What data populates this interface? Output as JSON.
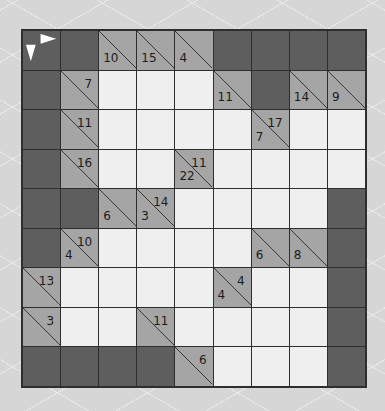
{
  "puzzle": {
    "type": "kakuro",
    "rows": 9,
    "cols": 9,
    "colors": {
      "block": "#5e5e5e",
      "clue": "#a5a5a5",
      "white": "#efefef",
      "grid_line": "#2e2e2e",
      "arrow": "#ffffff"
    },
    "grid": [
      [
        {
          "t": "start"
        },
        {
          "t": "X"
        },
        {
          "t": "C",
          "down": "10"
        },
        {
          "t": "C",
          "down": "15"
        },
        {
          "t": "C",
          "down": "4"
        },
        {
          "t": "X"
        },
        {
          "t": "X"
        },
        {
          "t": "X"
        },
        {
          "t": "X"
        }
      ],
      [
        {
          "t": "X"
        },
        {
          "t": "C",
          "right": "7"
        },
        {
          "t": "W"
        },
        {
          "t": "W"
        },
        {
          "t": "W"
        },
        {
          "t": "C",
          "down": "11"
        },
        {
          "t": "X"
        },
        {
          "t": "C",
          "down": "14"
        },
        {
          "t": "C",
          "down": "9"
        }
      ],
      [
        {
          "t": "X"
        },
        {
          "t": "C",
          "right": "11"
        },
        {
          "t": "W"
        },
        {
          "t": "W"
        },
        {
          "t": "W"
        },
        {
          "t": "W"
        },
        {
          "t": "C",
          "down": "7",
          "right": "17"
        },
        {
          "t": "W"
        },
        {
          "t": "W"
        }
      ],
      [
        {
          "t": "X"
        },
        {
          "t": "C",
          "right": "16"
        },
        {
          "t": "W"
        },
        {
          "t": "W"
        },
        {
          "t": "C",
          "down": "22",
          "right": "11"
        },
        {
          "t": "W"
        },
        {
          "t": "W"
        },
        {
          "t": "W"
        },
        {
          "t": "W"
        }
      ],
      [
        {
          "t": "X"
        },
        {
          "t": "X"
        },
        {
          "t": "C",
          "down": "6"
        },
        {
          "t": "C",
          "down": "3",
          "right": "14"
        },
        {
          "t": "W"
        },
        {
          "t": "W"
        },
        {
          "t": "W"
        },
        {
          "t": "W"
        },
        {
          "t": "X"
        }
      ],
      [
        {
          "t": "X"
        },
        {
          "t": "C",
          "down": "4",
          "right": "10"
        },
        {
          "t": "W"
        },
        {
          "t": "W"
        },
        {
          "t": "W"
        },
        {
          "t": "W"
        },
        {
          "t": "C",
          "down": "6"
        },
        {
          "t": "C",
          "down": "8"
        },
        {
          "t": "X"
        }
      ],
      [
        {
          "t": "C",
          "right": "13"
        },
        {
          "t": "W"
        },
        {
          "t": "W"
        },
        {
          "t": "W"
        },
        {
          "t": "W"
        },
        {
          "t": "C",
          "down": "4",
          "right": "4"
        },
        {
          "t": "W"
        },
        {
          "t": "W"
        },
        {
          "t": "X"
        }
      ],
      [
        {
          "t": "C",
          "right": "3"
        },
        {
          "t": "W"
        },
        {
          "t": "W"
        },
        {
          "t": "C",
          "right": "11"
        },
        {
          "t": "W"
        },
        {
          "t": "W"
        },
        {
          "t": "W"
        },
        {
          "t": "W"
        },
        {
          "t": "X"
        }
      ],
      [
        {
          "t": "X"
        },
        {
          "t": "X"
        },
        {
          "t": "X"
        },
        {
          "t": "X"
        },
        {
          "t": "C",
          "right": "6"
        },
        {
          "t": "W"
        },
        {
          "t": "W"
        },
        {
          "t": "W"
        },
        {
          "t": "X"
        }
      ]
    ]
  }
}
